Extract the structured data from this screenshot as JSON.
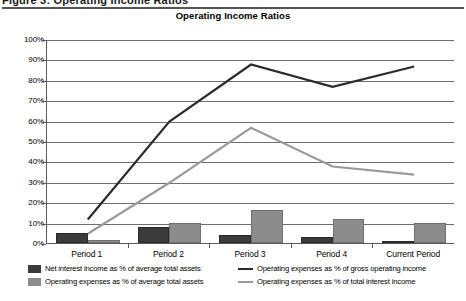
{
  "header": {
    "cropped_text": "Figure 3: Operating Income Ratios",
    "chart_title": "Operating Income Ratios"
  },
  "legend": {
    "bar_dark": "Net interest income as % of average total assets",
    "bar_light": "Operating expenses as % of average total assets",
    "line_dark": "Operating expenses as % of gross operating income",
    "line_light": "Operating expenses as % of total interest income"
  },
  "colors": {
    "bar_dark": "#3b3b3b",
    "bar_light": "#8c8c8c",
    "line_dark": "#2b2b2b",
    "line_light": "#9a9a9a",
    "grid": "#6e6e6e",
    "axis": "#5a5a5a"
  },
  "chart_data": {
    "type": "bar",
    "title": "Operating Income Ratios",
    "xlabel": "",
    "ylabel": "",
    "ylim": [
      0,
      100
    ],
    "ytick_labels": [
      "100%",
      "90%",
      "80%",
      "70%",
      "60%",
      "50%",
      "40%",
      "30%",
      "20%",
      "10%",
      "0%"
    ],
    "ytick_values": [
      100,
      90,
      80,
      70,
      60,
      50,
      40,
      30,
      20,
      10,
      0
    ],
    "grid": true,
    "legend_position": "bottom",
    "categories": [
      "Period 1",
      "Period 2",
      "Period 3",
      "Period 4",
      "Current Period"
    ],
    "series": [
      {
        "name": "Net interest income as % of average total assets",
        "type": "bar",
        "color": "#3b3b3b",
        "values": [
          5,
          8,
          4,
          3,
          1
        ]
      },
      {
        "name": "Operating expenses as % of average total assets",
        "type": "bar",
        "color": "#8c8c8c",
        "values": [
          1.5,
          10,
          16,
          12,
          10
        ]
      },
      {
        "name": "Operating expenses as % of gross operating income",
        "type": "line",
        "color": "#2b2b2b",
        "values": [
          12,
          60,
          88,
          77,
          87
        ]
      },
      {
        "name": "Operating expenses as % of total interest income",
        "type": "line",
        "color": "#9a9a9a",
        "values": [
          5,
          30,
          57,
          38,
          34
        ]
      }
    ]
  }
}
